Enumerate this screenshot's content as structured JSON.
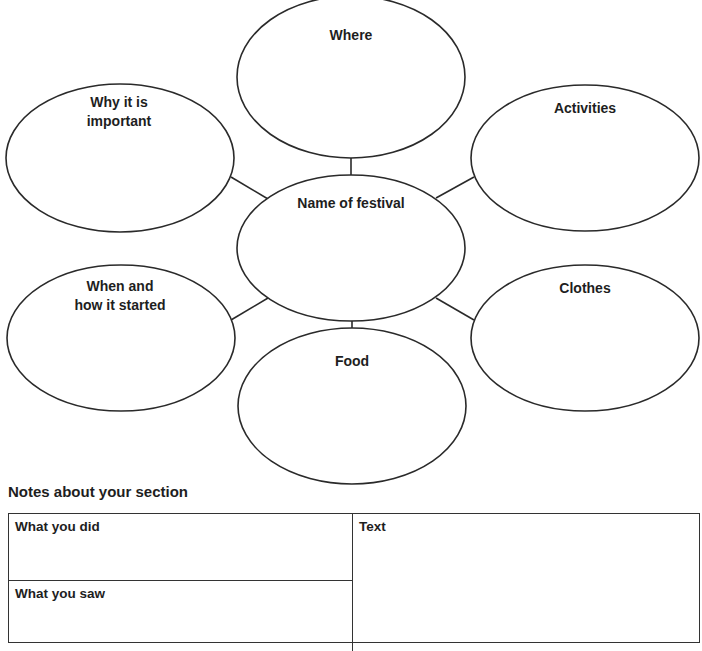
{
  "mind_map": {
    "center": {
      "label": "Name of festival"
    },
    "bubbles": {
      "where": {
        "label": "Where"
      },
      "why": {
        "label_line1": "Why it is",
        "label_line2": "important"
      },
      "activities": {
        "label": "Activities"
      },
      "when": {
        "label_line1": "When and",
        "label_line2": "how it started"
      },
      "clothes": {
        "label": "Clothes"
      },
      "food": {
        "label": "Food"
      }
    },
    "stroke_color": "#2a2a2a"
  },
  "notes": {
    "title": "Notes about your section",
    "cells": {
      "what_you_did": "What you did",
      "what_you_saw": "What you saw",
      "text": "Text"
    }
  }
}
